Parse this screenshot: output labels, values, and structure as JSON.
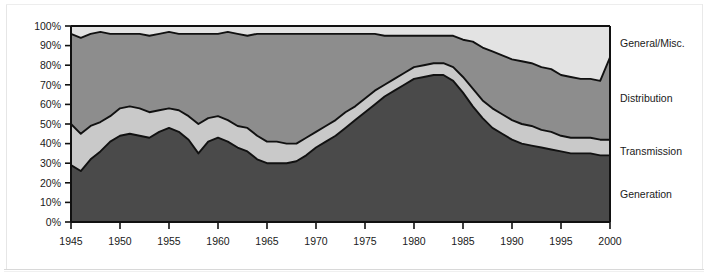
{
  "colors": {
    "generation": "#4a4a4a",
    "transmission": "#c9c9c9",
    "distribution": "#8d8d8d",
    "general": "#e3e3e3",
    "outline": "#111111",
    "axis": "#111111",
    "background": "#ffffff",
    "text": "#1a1a1a"
  },
  "axes": {
    "y_ticks": [
      "0%",
      "10%",
      "20%",
      "30%",
      "40%",
      "50%",
      "60%",
      "70%",
      "80%",
      "90%",
      "100%"
    ],
    "x_ticks": [
      "1945",
      "1950",
      "1955",
      "1960",
      "1965",
      "1970",
      "1975",
      "1980",
      "1985",
      "1990",
      "1995",
      "2000"
    ]
  },
  "legend": {
    "items": [
      {
        "key": "general",
        "label": "General/Misc."
      },
      {
        "key": "distribution",
        "label": "Distribution"
      },
      {
        "key": "transmission",
        "label": "Transmission"
      },
      {
        "key": "generation",
        "label": "Generation"
      }
    ]
  },
  "chart_data": {
    "type": "area",
    "stacked": true,
    "normalized": true,
    "title": "",
    "xlabel": "",
    "ylabel": "",
    "xlim": [
      1945,
      2000
    ],
    "ylim": [
      0,
      100
    ],
    "grid": false,
    "legend_position": "right",
    "x": [
      1945,
      1946,
      1947,
      1948,
      1949,
      1950,
      1951,
      1952,
      1953,
      1954,
      1955,
      1956,
      1957,
      1958,
      1959,
      1960,
      1961,
      1962,
      1963,
      1964,
      1965,
      1966,
      1967,
      1968,
      1969,
      1970,
      1971,
      1972,
      1973,
      1974,
      1975,
      1976,
      1977,
      1978,
      1979,
      1980,
      1981,
      1982,
      1983,
      1984,
      1985,
      1986,
      1987,
      1988,
      1989,
      1990,
      1991,
      1992,
      1993,
      1994,
      1995,
      1996,
      1997,
      1998,
      1999,
      2000
    ],
    "series": [
      {
        "name": "Generation",
        "values": [
          29,
          26,
          32,
          36,
          41,
          44,
          45,
          44,
          43,
          46,
          48,
          46,
          42,
          35,
          41,
          43,
          41,
          38,
          36,
          32,
          30,
          30,
          30,
          31,
          34,
          38,
          41,
          44,
          48,
          52,
          56,
          60,
          64,
          67,
          70,
          73,
          74,
          75,
          75,
          72,
          66,
          59,
          53,
          48,
          45,
          42,
          40,
          39,
          38,
          37,
          36,
          35,
          35,
          35,
          34,
          34
        ]
      },
      {
        "name": "Transmission",
        "values": [
          21,
          19,
          17,
          15,
          13,
          14,
          14,
          14,
          13,
          11,
          10,
          11,
          12,
          15,
          12,
          11,
          11,
          11,
          12,
          12,
          11,
          11,
          10,
          9,
          9,
          8,
          8,
          8,
          8,
          7,
          7,
          7,
          6,
          6,
          6,
          6,
          6,
          6,
          6,
          7,
          8,
          9,
          9,
          10,
          10,
          10,
          10,
          10,
          9,
          9,
          8,
          8,
          8,
          8,
          8,
          8
        ]
      },
      {
        "name": "Distribution",
        "values": [
          46,
          49,
          47,
          46,
          42,
          38,
          37,
          38,
          39,
          39,
          39,
          39,
          42,
          46,
          43,
          42,
          45,
          47,
          47,
          52,
          55,
          55,
          56,
          56,
          53,
          50,
          47,
          44,
          40,
          37,
          33,
          29,
          25,
          22,
          19,
          16,
          15,
          14,
          14,
          16,
          19,
          24,
          27,
          29,
          30,
          31,
          32,
          32,
          32,
          32,
          31,
          31,
          30,
          30,
          30,
          42
        ]
      },
      {
        "name": "General/Misc.",
        "values": [
          4,
          6,
          4,
          3,
          4,
          4,
          4,
          4,
          5,
          4,
          3,
          4,
          4,
          4,
          4,
          4,
          3,
          4,
          5,
          4,
          4,
          4,
          4,
          4,
          4,
          4,
          4,
          4,
          4,
          4,
          4,
          4,
          5,
          5,
          5,
          5,
          5,
          5,
          5,
          5,
          7,
          8,
          11,
          13,
          15,
          17,
          18,
          19,
          21,
          22,
          25,
          26,
          27,
          27,
          28,
          16
        ]
      }
    ]
  }
}
